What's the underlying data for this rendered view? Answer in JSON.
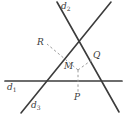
{
  "figure": {
    "type": "geometry-diagram",
    "width": 128,
    "height": 120,
    "background_color": "#ffffff",
    "stroke_color": "#3c3c3c",
    "dashed_color": "#8c8c8c",
    "label_color": "#3b3b3b"
  },
  "lines": [
    {
      "id": "d1",
      "label": "d",
      "subscript": "1",
      "description": "horizontal line",
      "x1": 5,
      "y1": 81,
      "x2": 122,
      "y2": 81,
      "label_x": 8,
      "label_y": 84
    },
    {
      "id": "d2",
      "label": "d",
      "subscript": "2",
      "description": "line descending from upper-left to lower-right",
      "x1": 57,
      "y1": 2,
      "x2": 119,
      "y2": 112,
      "label_x": 62,
      "label_y": 4
    },
    {
      "id": "d3",
      "label": "d",
      "subscript": "3",
      "description": "line ascending from lower-left to upper-right",
      "x1": 21,
      "y1": 113,
      "x2": 111,
      "y2": 2,
      "label_x": 31,
      "label_y": 103
    }
  ],
  "points": [
    {
      "id": "R",
      "label": "R",
      "x": 56,
      "y": 52,
      "label_x": 39,
      "label_y": 41
    },
    {
      "id": "Q",
      "label": "Q",
      "x": 88,
      "y": 62,
      "label_x": 93,
      "label_y": 54
    },
    {
      "id": "M",
      "label": "M",
      "x": 78,
      "y": 70,
      "label_x": 65,
      "label_y": 64
    },
    {
      "id": "P",
      "label": "P",
      "x": 78,
      "y": 93,
      "label_x": 75,
      "label_y": 95
    }
  ],
  "dashed_segments": [
    {
      "id": "M-R",
      "from": "M",
      "to": "R",
      "x1": 78,
      "y1": 70,
      "x2": 47,
      "y2": 44
    },
    {
      "id": "M-Q",
      "from": "M",
      "to": "Q",
      "x1": 78,
      "y1": 70,
      "x2": 93,
      "y2": 59
    },
    {
      "id": "M-P",
      "from": "M",
      "to": "P",
      "x1": 78,
      "y1": 70,
      "x2": 78,
      "y2": 92
    }
  ]
}
